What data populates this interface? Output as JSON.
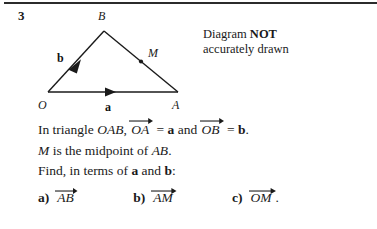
{
  "page": {
    "question_number": "3",
    "background_color": "#ffffff",
    "ink_color": "#1a1a1a"
  },
  "note": {
    "line1_prefix": "Diagram ",
    "line1_bold": "NOT",
    "line2": "accurately drawn"
  },
  "diagram": {
    "type": "triangle-vector-diagram",
    "vertices": [
      {
        "name": "O",
        "label": "O",
        "x": 48,
        "y": 92,
        "label_x": 41,
        "label_y": 106
      },
      {
        "name": "A",
        "label": "A",
        "x": 178,
        "y": 92,
        "label_x": 174,
        "label_y": 106
      },
      {
        "name": "B",
        "label": "B",
        "x": 104,
        "y": 31,
        "label_x": 100,
        "label_y": 19
      }
    ],
    "midpoint": {
      "name": "M",
      "label": "M",
      "x": 141,
      "y": 61,
      "label_x": 149,
      "label_y": 57,
      "dot_radius": 2
    },
    "vector_labels": [
      {
        "name": "a",
        "label": "a",
        "x": 109,
        "y": 107,
        "on_edge": "OA"
      },
      {
        "name": "b",
        "label": "b",
        "x": 60,
        "y": 58,
        "on_edge": "OB"
      }
    ],
    "arrowheads": [
      {
        "on_edge": "OA",
        "at_x": 113,
        "at_y": 92
      },
      {
        "on_edge": "OB",
        "at_x": 79,
        "at_y": 62
      }
    ],
    "stroke_color": "#1a1a1a",
    "stroke_width": 1.4
  },
  "body": {
    "line1": {
      "part1": "In triangle ",
      "triangle_name": "OAB",
      "comma": ", ",
      "vec1": "OA",
      "eq1": " = ",
      "bold1": "a",
      "conj": " and ",
      "vec2": "OB",
      "eq2": " = ",
      "bold2": "b",
      "period": "."
    },
    "line2": {
      "m": "M",
      "text": " is the midpoint of ",
      "segment": "AB",
      "period": "."
    },
    "line3": {
      "prefix": "Find, in terms of ",
      "bold1": "a",
      "conj": " and ",
      "bold2": "b",
      "suffix": ":"
    }
  },
  "answers": [
    {
      "label": "a)",
      "vector": "AB",
      "trailing": ""
    },
    {
      "label": "b)",
      "vector": "AM",
      "trailing": ""
    },
    {
      "label": "c)",
      "vector": "OM",
      "trailing": "."
    }
  ]
}
